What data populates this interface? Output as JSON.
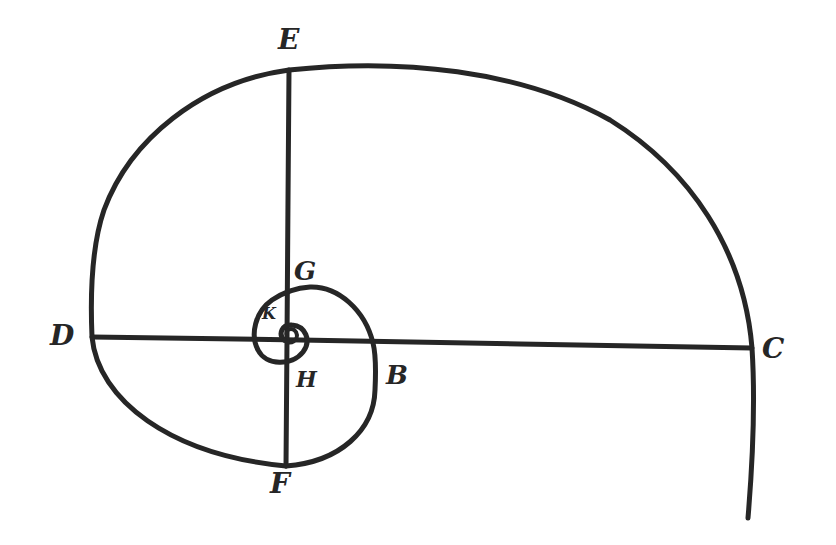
{
  "diagram": {
    "type": "hand-drawn logarithmic spiral with axes",
    "stroke_color": "#262626",
    "background": "#ffffff",
    "labels": [
      {
        "id": "E",
        "text": "E",
        "x": 278,
        "y": 26,
        "size": 28
      },
      {
        "id": "G",
        "text": "G",
        "x": 294,
        "y": 258,
        "size": 26
      },
      {
        "id": "D",
        "text": "D",
        "x": 50,
        "y": 322,
        "size": 28
      },
      {
        "id": "K",
        "text": "K",
        "x": 260,
        "y": 307,
        "size": 16
      },
      {
        "id": "H",
        "text": "H",
        "x": 296,
        "y": 368,
        "size": 22
      },
      {
        "id": "B",
        "text": "B",
        "x": 386,
        "y": 362,
        "size": 26
      },
      {
        "id": "C",
        "text": "C",
        "x": 762,
        "y": 335,
        "size": 28
      },
      {
        "id": "F",
        "text": "F",
        "x": 270,
        "y": 470,
        "size": 28
      }
    ],
    "lines": [
      {
        "name": "horizontal-axis-DC",
        "from": "D",
        "to": "C"
      },
      {
        "name": "vertical-axis-EF",
        "from": "E",
        "to": "F"
      }
    ]
  }
}
